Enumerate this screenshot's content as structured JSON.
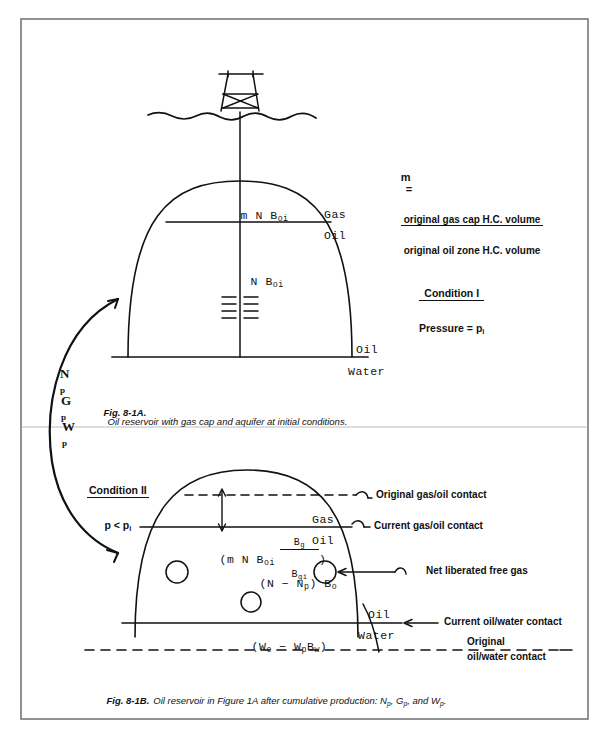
{
  "figure": {
    "domain": "petroleum-engineering-diagram",
    "page_border": true,
    "border_color": "#6f6f6f",
    "ink_color": "#111111"
  },
  "ratio_formula": {
    "lhs": "m",
    "equals": "=",
    "numerator": "original gas cap H.C. volume",
    "denominator": "original oil zone H.C. volume"
  },
  "panel_a": {
    "condition": {
      "top": "Condition I",
      "bottom_prefix": "Pressure = p",
      "bottom_sub": "i"
    },
    "labels": {
      "gas_cap_volume": {
        "text": "m N B",
        "sub": "oi"
      },
      "oil_volume": {
        "text": "N B",
        "sub": "oi"
      },
      "gas": "Gas",
      "oil_upper": "Oil",
      "oil_lower": "Oil",
      "water": "Water"
    },
    "caption_prefix": "Fig. 8-1A.",
    "caption_text": "Oil reservoir with gas cap and aquifer at initial conditions."
  },
  "transition_arrow": {
    "symbols": [
      {
        "main": "N",
        "sub": "p"
      },
      {
        "main": "G",
        "sub": "p"
      },
      {
        "main": "W",
        "sub": "p"
      }
    ]
  },
  "panel_b": {
    "condition": {
      "top": "Condition II",
      "bottom_prefix": "p < p",
      "bottom_sub": "i"
    },
    "labels": {
      "gas_cap_expansion": {
        "open_paren": "(",
        "text": "m N B",
        "sub": "oi",
        "frac_num": "B",
        "frac_num_sub": "g",
        "frac_den": "B",
        "frac_den_sub": "gi",
        "close_paren": ")"
      },
      "oil_remaining": {
        "text_a": "(N − N",
        "sub_a": "p",
        "text_b": ") B",
        "sub_b": "o"
      },
      "water_influx": {
        "text_a": "(W",
        "sub_a": "e",
        "text_b": " − W",
        "sub_b": "p",
        "text_c": "B",
        "sub_c": "w",
        "text_d": ")"
      },
      "gas": "Gas",
      "oil_upper": "Oil",
      "oil_lower": "Oil",
      "water": "Water"
    },
    "annotations": [
      {
        "id": "original-gas-oil-contact",
        "text": "Original gas/oil contact"
      },
      {
        "id": "current-gas-oil-contact",
        "text": "Current gas/oil contact"
      },
      {
        "id": "net-liberated-free-gas",
        "text": "Net liberated free gas"
      },
      {
        "id": "current-oil-water-contact",
        "text": "Current oil/water contact"
      },
      {
        "id": "original-oil-water-contact-line1",
        "text": "Original"
      },
      {
        "id": "original-oil-water-contact-line2",
        "text": "oil/water contact"
      }
    ],
    "caption_prefix": "Fig. 8-1B.",
    "caption_text_1": "Oil reservoir in Figure 1A after cumulative production: ",
    "caption_np": "N",
    "caption_np_sub": "p",
    "caption_sep1": ", ",
    "caption_gp": "G",
    "caption_gp_sub": "p",
    "caption_sep2": ", and ",
    "caption_wp": "W",
    "caption_wp_sub": "p",
    "caption_end": "."
  }
}
